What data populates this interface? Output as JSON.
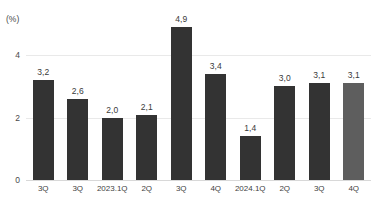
{
  "chart_data": {
    "type": "bar",
    "title": "",
    "subtitle": "",
    "xlabel": "",
    "ylabel": "(%)",
    "unit_label": "(%)",
    "categories": [
      "3Q",
      "3Q",
      "2023.1Q",
      "2Q",
      "3Q",
      "4Q",
      "2024.1Q",
      "2Q",
      "3Q",
      "4Q"
    ],
    "values": [
      3.2,
      2.6,
      2.0,
      2.1,
      4.9,
      3.4,
      1.4,
      3.0,
      3.1,
      3.1
    ],
    "value_labels": [
      "3,2",
      "2,6",
      "2,0",
      "2,1",
      "4,9",
      "3,4",
      "1,4",
      "3,0",
      "3,1",
      "3,1"
    ],
    "ylim": [
      0,
      5.45
    ],
    "yticks": [
      0,
      2,
      4
    ],
    "ytick_labels": [
      "0",
      "2",
      "4"
    ],
    "grid": true,
    "legend": "none",
    "bar_colors": [
      "#333333",
      "#333333",
      "#333333",
      "#333333",
      "#333333",
      "#333333",
      "#333333",
      "#333333",
      "#333333",
      "#5e5e5e"
    ],
    "highlight_index": 9,
    "colors": {
      "bar_default": "#333333",
      "bar_highlight": "#5e5e5e",
      "background": "#ffffff",
      "gridline": "#e9e9e9",
      "baseline": "#d8d8d8",
      "text": "#3a3a3a"
    }
  }
}
